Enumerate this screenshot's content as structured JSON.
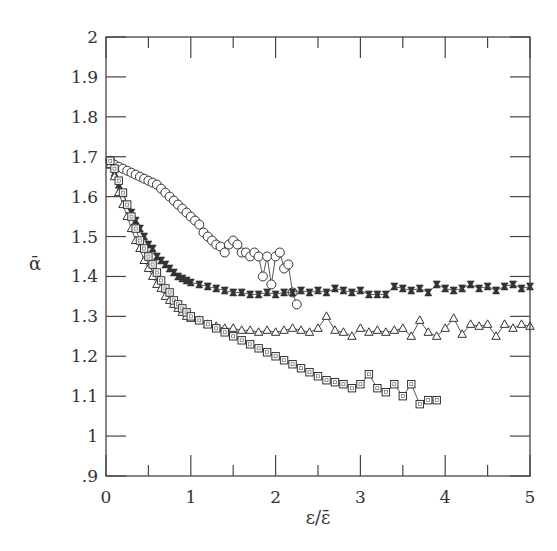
{
  "chart_data": {
    "type": "scatter",
    "title": "",
    "xlabel": "ε/ε̄",
    "ylabel": "ᾱ",
    "xlim": [
      0,
      5
    ],
    "ylim": [
      0.9,
      2.0
    ],
    "xticks": [
      0,
      1,
      2,
      3,
      4,
      5
    ],
    "xtick_labels": [
      "0",
      "1",
      "2",
      "3",
      "4",
      "5"
    ],
    "yticks": [
      0.9,
      1.0,
      1.1,
      1.2,
      1.3,
      1.4,
      1.5,
      1.6,
      1.7,
      1.8,
      1.9,
      2.0
    ],
    "ytick_labels": [
      ".9",
      "1",
      "1.1",
      "1.2",
      "1.3",
      "1.4",
      "1.5",
      "1.6",
      "1.7",
      "1.8",
      "1.9",
      "2"
    ],
    "grid": false,
    "legend": null,
    "series": [
      {
        "name": "circles",
        "marker": "circle",
        "x": [
          0.05,
          0.1,
          0.15,
          0.2,
          0.25,
          0.3,
          0.35,
          0.4,
          0.45,
          0.5,
          0.55,
          0.6,
          0.65,
          0.7,
          0.75,
          0.8,
          0.85,
          0.9,
          0.95,
          1.0,
          1.05,
          1.1,
          1.15,
          1.2,
          1.25,
          1.3,
          1.35,
          1.4,
          1.45,
          1.5,
          1.55,
          1.6,
          1.65,
          1.7,
          1.75,
          1.8,
          1.85,
          1.9,
          1.95,
          2.0,
          2.05,
          2.1,
          2.15,
          2.2,
          2.25
        ],
        "y": [
          1.69,
          1.68,
          1.675,
          1.67,
          1.665,
          1.66,
          1.655,
          1.65,
          1.645,
          1.64,
          1.635,
          1.63,
          1.62,
          1.61,
          1.6,
          1.59,
          1.58,
          1.57,
          1.56,
          1.55,
          1.54,
          1.53,
          1.51,
          1.5,
          1.49,
          1.48,
          1.475,
          1.46,
          1.48,
          1.49,
          1.48,
          1.46,
          1.46,
          1.45,
          1.46,
          1.45,
          1.4,
          1.45,
          1.38,
          1.45,
          1.46,
          1.42,
          1.43,
          1.36,
          1.33
        ]
      },
      {
        "name": "filled squares",
        "marker": "filled-square",
        "x": [
          0.05,
          0.1,
          0.15,
          0.2,
          0.25,
          0.3,
          0.35,
          0.4,
          0.45,
          0.5,
          0.55,
          0.6,
          0.65,
          0.7,
          0.75,
          0.8,
          0.85,
          0.9,
          0.95,
          1.0,
          1.1,
          1.2,
          1.3,
          1.4,
          1.5,
          1.6,
          1.7,
          1.8,
          1.9,
          2.0,
          2.1,
          2.2,
          2.3,
          2.4,
          2.5,
          2.6,
          2.7,
          2.8,
          2.9,
          3.0,
          3.1,
          3.2,
          3.3,
          3.4,
          3.5,
          3.6,
          3.7,
          3.8,
          3.9,
          4.0,
          4.1,
          4.2,
          4.3,
          4.4,
          4.5,
          4.6,
          4.7,
          4.8,
          4.9,
          5.0
        ],
        "y": [
          1.68,
          1.66,
          1.63,
          1.61,
          1.58,
          1.56,
          1.54,
          1.52,
          1.5,
          1.48,
          1.47,
          1.45,
          1.44,
          1.43,
          1.42,
          1.41,
          1.4,
          1.395,
          1.39,
          1.385,
          1.38,
          1.375,
          1.37,
          1.365,
          1.36,
          1.36,
          1.355,
          1.355,
          1.36,
          1.355,
          1.36,
          1.36,
          1.365,
          1.36,
          1.365,
          1.36,
          1.37,
          1.365,
          1.36,
          1.365,
          1.355,
          1.355,
          1.355,
          1.375,
          1.37,
          1.365,
          1.37,
          1.36,
          1.38,
          1.37,
          1.365,
          1.37,
          1.38,
          1.37,
          1.375,
          1.365,
          1.375,
          1.38,
          1.37,
          1.375
        ]
      },
      {
        "name": "triangles",
        "marker": "triangle",
        "x": [
          0.05,
          0.1,
          0.15,
          0.2,
          0.25,
          0.3,
          0.35,
          0.4,
          0.45,
          0.5,
          0.55,
          0.6,
          0.65,
          0.7,
          0.75,
          0.8,
          0.85,
          0.9,
          0.95,
          1.0,
          1.1,
          1.2,
          1.3,
          1.4,
          1.5,
          1.6,
          1.7,
          1.8,
          1.9,
          2.0,
          2.1,
          2.2,
          2.3,
          2.4,
          2.5,
          2.6,
          2.7,
          2.8,
          2.9,
          3.0,
          3.1,
          3.2,
          3.3,
          3.4,
          3.5,
          3.6,
          3.7,
          3.8,
          3.9,
          4.0,
          4.1,
          4.2,
          4.3,
          4.4,
          4.5,
          4.6,
          4.7,
          4.8,
          4.9,
          5.0
        ],
        "y": [
          1.68,
          1.65,
          1.61,
          1.58,
          1.55,
          1.52,
          1.49,
          1.47,
          1.44,
          1.42,
          1.4,
          1.38,
          1.37,
          1.35,
          1.34,
          1.33,
          1.32,
          1.31,
          1.3,
          1.295,
          1.29,
          1.28,
          1.275,
          1.27,
          1.27,
          1.265,
          1.265,
          1.26,
          1.265,
          1.26,
          1.265,
          1.27,
          1.265,
          1.26,
          1.27,
          1.3,
          1.265,
          1.26,
          1.25,
          1.27,
          1.26,
          1.265,
          1.26,
          1.265,
          1.27,
          1.25,
          1.29,
          1.26,
          1.25,
          1.27,
          1.295,
          1.255,
          1.28,
          1.275,
          1.28,
          1.25,
          1.28,
          1.27,
          1.28,
          1.275
        ]
      },
      {
        "name": "open squares",
        "marker": "square",
        "x": [
          0.05,
          0.1,
          0.15,
          0.2,
          0.25,
          0.3,
          0.35,
          0.4,
          0.45,
          0.5,
          0.55,
          0.6,
          0.65,
          0.7,
          0.75,
          0.8,
          0.85,
          0.9,
          0.95,
          1.0,
          1.1,
          1.2,
          1.3,
          1.4,
          1.5,
          1.6,
          1.7,
          1.8,
          1.9,
          2.0,
          2.1,
          2.2,
          2.3,
          2.4,
          2.5,
          2.6,
          2.7,
          2.8,
          2.9,
          3.0,
          3.1,
          3.2,
          3.3,
          3.4,
          3.5,
          3.6,
          3.7,
          3.8,
          3.9
        ],
        "y": [
          1.69,
          1.67,
          1.64,
          1.61,
          1.58,
          1.55,
          1.52,
          1.49,
          1.47,
          1.45,
          1.43,
          1.41,
          1.39,
          1.37,
          1.36,
          1.34,
          1.33,
          1.32,
          1.31,
          1.3,
          1.29,
          1.28,
          1.27,
          1.26,
          1.25,
          1.24,
          1.23,
          1.22,
          1.21,
          1.2,
          1.19,
          1.18,
          1.17,
          1.16,
          1.15,
          1.14,
          1.135,
          1.13,
          1.12,
          1.13,
          1.155,
          1.12,
          1.11,
          1.13,
          1.1,
          1.13,
          1.08,
          1.09,
          1.09
        ]
      }
    ]
  }
}
